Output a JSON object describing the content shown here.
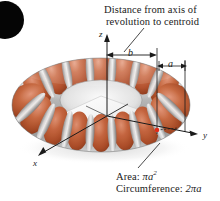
{
  "figure": {
    "title_annotation_line1": "Distance from axis of",
    "title_annotation_line2": "revolution to centroid",
    "axes": {
      "z": "z",
      "y": "y",
      "x": "x"
    },
    "dimensions": {
      "major_radius": "b",
      "minor_radius": "a"
    },
    "notes": {
      "area_label": "Area: ",
      "area_value_base": "πa",
      "area_value_exp": "2",
      "circumference_label": "Circumference: ",
      "circumference_value": "2πa"
    },
    "colors": {
      "torus_orange_light": "#d98b6a",
      "torus_orange": "#c2623c",
      "torus_orange_dark": "#8d3f22",
      "band_silver_light": "#e6e6e6",
      "band_silver": "#b4b4b4",
      "band_silver_dark": "#7d7d7d",
      "centroid_dot": "#e02b16",
      "line_black": "#1a1a1a",
      "inner_plane": "#f2f2f2",
      "corner_blob": "#050505",
      "background": "#ffffff"
    }
  }
}
